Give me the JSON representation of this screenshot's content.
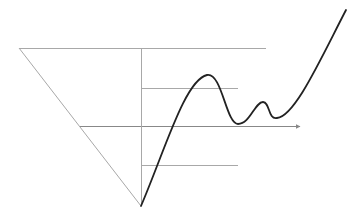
{
  "diagram": {
    "width": 363,
    "height": 219,
    "colors": {
      "background": "#ffffff",
      "guide_line": "#a8a8a8",
      "curve": "#222222",
      "arrow": "#888888"
    },
    "triangle": {
      "top_left": [
        19,
        48
      ],
      "top_right": [
        266,
        48
      ],
      "apex": [
        141,
        206
      ]
    },
    "vertical_axis": {
      "x": 141,
      "y_top": 48,
      "y_bottom": 206
    },
    "horizontal_lines": [
      {
        "name": "top-line",
        "y": 48,
        "x1": 19,
        "x2": 266
      },
      {
        "name": "upper-level-line",
        "y": 88,
        "x1": 141,
        "x2": 238
      },
      {
        "name": "middle-axis-line",
        "y": 126,
        "x1": 80,
        "x2": 300,
        "arrow": true
      },
      {
        "name": "lower-level-line",
        "y": 165,
        "x1": 141,
        "x2": 238
      }
    ],
    "curve": {
      "start": [
        141,
        206
      ],
      "peak_1": [
        207,
        75
      ],
      "trough_1": [
        238,
        124
      ],
      "peak_2": [
        263,
        102
      ],
      "trough_2": [
        277,
        118
      ],
      "end": [
        346,
        10
      ]
    }
  }
}
